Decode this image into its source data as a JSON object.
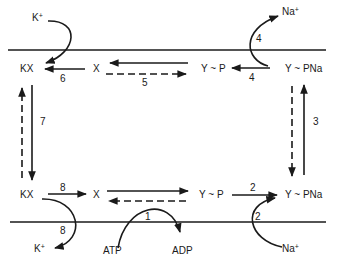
{
  "diagram": {
    "type": "Na+/K+ ATPase reaction cycle",
    "colors": {
      "ink": "#1a1a1a",
      "background": "#ffffff"
    },
    "membrane": {
      "top_line": "outside membrane boundary",
      "bottom_line": "inside membrane boundary"
    },
    "top_row": {
      "kx": "KX",
      "x": "X",
      "ypn": "Y ~ P",
      "ypna": "Y ~ PNa",
      "k_ion": "K",
      "k_charge": "+",
      "na_ion": "Na",
      "na_charge": "+"
    },
    "bottom_row": {
      "kx": "KX",
      "x": "X",
      "ypn": "Y ~ P",
      "ypna": "Y ~ PNa",
      "k_ion": "K",
      "k_charge": "+",
      "na_ion": "Na",
      "na_charge": "+",
      "atp": "ATP",
      "adp": "ADP"
    },
    "steps": {
      "s1": "1",
      "s2a": "2",
      "s2b": "2",
      "s3": "3",
      "s4a": "4",
      "s4b": "4",
      "s5": "5",
      "s6": "6",
      "s7": "7",
      "s8a": "8",
      "s8b": "8"
    }
  }
}
